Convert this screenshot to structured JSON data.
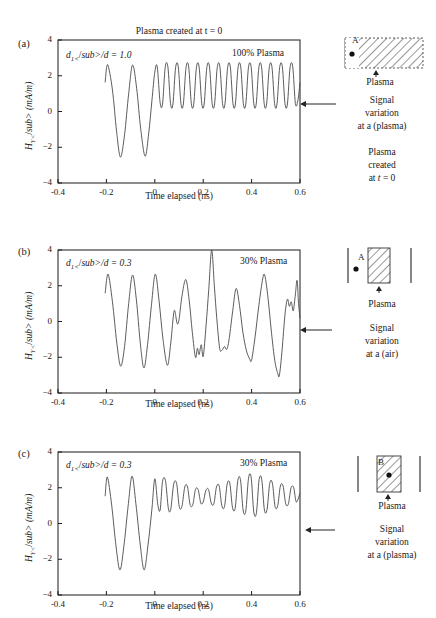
{
  "figure": {
    "title": "Plasma created at t = 0",
    "axis": {
      "xlabel": "Time elapsed (ns)",
      "ylabel_html": "H<sub>Y</sub> (mA/m)",
      "xticks": [
        "-0.4",
        "-0.2",
        "0",
        "0.2",
        "0.4",
        "0.6"
      ],
      "yticks": [
        "4",
        "2",
        "0",
        "-2",
        "-4"
      ],
      "xlim": [
        -0.4,
        0.6
      ],
      "ylim": [
        -4,
        4
      ]
    },
    "line_color": "#4a4a4a",
    "axis_color": "#1a1a1a"
  },
  "panels": [
    {
      "letter": "(a)",
      "ratio_label_html": "d<sub>1</sub>/d = 1.0",
      "percent_label": "100% Plasma",
      "title": "Plasma created at t = 0",
      "diagram": {
        "point_label": "A",
        "plasma_label": "Plasma",
        "type": "full-hatched-region"
      },
      "side_note_lines": [
        "Signal",
        "variation",
        "at a (plasma)"
      ],
      "extra_note_lines": [
        "Plasma",
        "created",
        "at t = 0"
      ]
    },
    {
      "letter": "(b)",
      "ratio_label_html": "d<sub>1</sub>/d = 0.3",
      "percent_label": "30% Plasma",
      "diagram": {
        "point_label": "A",
        "plasma_label": "Plasma",
        "type": "slab-right-of-point"
      },
      "side_note_lines": [
        "Signal",
        "variation",
        "at a (air)"
      ],
      "extra_note_lines": []
    },
    {
      "letter": "(c)",
      "ratio_label_html": "d<sub>1</sub>/d = 0.3",
      "percent_label": "30% Plasma",
      "diagram": {
        "point_label": "B",
        "plasma_label": "Plasma",
        "type": "point-inside-slab"
      },
      "side_note_lines": [
        "Signal",
        "variation",
        "at a (plasma)"
      ],
      "extra_note_lines": []
    }
  ],
  "chart_data": {
    "type": "line",
    "title": "Plasma created at t = 0",
    "xlabel": "Time elapsed (ns)",
    "ylabel": "H_Y (mA/m)",
    "xlim": [
      -0.4,
      0.6
    ],
    "ylim": [
      -4,
      4
    ],
    "xticks": [
      -0.4,
      -0.2,
      0,
      0.2,
      0.4,
      0.6
    ],
    "yticks": [
      -4,
      -2,
      0,
      2,
      4
    ],
    "grid": false,
    "legend": "none",
    "series": [
      {
        "name": "(a) 100% Plasma, d1/d = 1.0",
        "description": "Signal starts at t = -0.205 ns with two large low-frequency oscillations of amplitude about 2.6, then after t = 0 settles into a steady high-frequency ripple oscillating between about 0.4 and 2.5 around a mean of 1.45.",
        "signal_start_x": -0.205,
        "pre_zero_freq_ghz": 12.5,
        "pre_zero_amplitude": 2.6,
        "post_zero_freq_ghz": 23.5,
        "post_zero_amplitude": 1.05,
        "post_zero_offset": 1.45,
        "points": [
          [
            -0.205,
            1.65
          ],
          [
            -0.195,
            2.62
          ],
          [
            -0.175,
            1.2
          ],
          [
            -0.158,
            -1.1
          ],
          [
            -0.142,
            -2.55
          ],
          [
            -0.125,
            -1.3
          ],
          [
            -0.108,
            1.0
          ],
          [
            -0.092,
            2.6
          ],
          [
            -0.075,
            1.3
          ],
          [
            -0.058,
            -1.0
          ],
          [
            -0.04,
            -2.5
          ],
          [
            -0.025,
            -1.2
          ],
          [
            -0.012,
            0.6
          ],
          [
            0.0,
            2.2
          ],
          [
            0.01,
            2.5
          ],
          [
            0.022,
            0.5
          ],
          [
            0.032,
            0.42
          ],
          [
            0.043,
            2.48
          ],
          [
            0.054,
            2.5
          ],
          [
            0.065,
            0.45
          ],
          [
            0.075,
            0.42
          ],
          [
            0.086,
            2.46
          ],
          [
            0.097,
            2.5
          ],
          [
            0.108,
            0.44
          ],
          [
            0.118,
            0.42
          ],
          [
            0.129,
            2.46
          ],
          [
            0.14,
            2.5
          ],
          [
            0.151,
            0.44
          ],
          [
            0.161,
            0.42
          ],
          [
            0.172,
            2.46
          ],
          [
            0.183,
            2.5
          ],
          [
            0.194,
            0.44
          ],
          [
            0.204,
            0.42
          ],
          [
            0.215,
            2.46
          ],
          [
            0.226,
            2.5
          ],
          [
            0.237,
            0.44
          ],
          [
            0.247,
            0.42
          ],
          [
            0.258,
            2.46
          ],
          [
            0.269,
            2.5
          ],
          [
            0.28,
            0.44
          ],
          [
            0.29,
            0.42
          ],
          [
            0.301,
            2.46
          ],
          [
            0.312,
            2.5
          ],
          [
            0.323,
            0.44
          ],
          [
            0.333,
            0.42
          ],
          [
            0.344,
            2.46
          ],
          [
            0.355,
            2.5
          ],
          [
            0.366,
            0.44
          ],
          [
            0.376,
            0.42
          ],
          [
            0.387,
            2.46
          ],
          [
            0.398,
            2.5
          ],
          [
            0.409,
            0.44
          ],
          [
            0.419,
            0.42
          ],
          [
            0.43,
            2.46
          ],
          [
            0.441,
            2.5
          ],
          [
            0.452,
            0.44
          ],
          [
            0.462,
            0.42
          ],
          [
            0.473,
            2.46
          ],
          [
            0.484,
            2.5
          ],
          [
            0.495,
            0.44
          ],
          [
            0.505,
            0.42
          ],
          [
            0.516,
            2.46
          ],
          [
            0.527,
            2.5
          ],
          [
            0.538,
            0.44
          ],
          [
            0.548,
            0.42
          ],
          [
            0.559,
            2.46
          ],
          [
            0.57,
            2.5
          ],
          [
            0.581,
            0.44
          ],
          [
            0.591,
            0.6
          ],
          [
            0.6,
            1.6
          ]
        ]
      },
      {
        "name": "(b) 30% Plasma, d1/d = 0.3, observed in air",
        "description": "Irregular beating waveform with mixed frequencies; largest positive peak reaches 4.0 at about t = 0.235 ns and the deepest trough reaches about -3.0 near t = 0.515 ns.",
        "signal_start_x": -0.205,
        "max_value": 4.0,
        "max_at_x": 0.235,
        "min_value": -3.0,
        "min_at_x": 0.515,
        "points": [
          [
            -0.205,
            1.6
          ],
          [
            -0.193,
            2.65
          ],
          [
            -0.175,
            1.1
          ],
          [
            -0.157,
            -1.2
          ],
          [
            -0.141,
            -2.5
          ],
          [
            -0.125,
            -1.4
          ],
          [
            -0.108,
            1.0
          ],
          [
            -0.092,
            2.6
          ],
          [
            -0.076,
            1.2
          ],
          [
            -0.06,
            -1.2
          ],
          [
            -0.045,
            -2.6
          ],
          [
            -0.03,
            -1.3
          ],
          [
            -0.014,
            0.9
          ],
          [
            0.002,
            2.65
          ],
          [
            0.018,
            1.1
          ],
          [
            0.034,
            -1.0
          ],
          [
            0.052,
            -2.45
          ],
          [
            0.066,
            -1.2
          ],
          [
            0.08,
            0.6
          ],
          [
            0.092,
            -0.1
          ],
          [
            0.1,
            0.1
          ],
          [
            0.112,
            1.4
          ],
          [
            0.128,
            2.35
          ],
          [
            0.142,
            1.2
          ],
          [
            0.155,
            -0.6
          ],
          [
            0.168,
            -2.0
          ],
          [
            0.176,
            -1.5
          ],
          [
            0.183,
            -1.85
          ],
          [
            0.192,
            -1.3
          ],
          [
            0.2,
            -1.95
          ],
          [
            0.212,
            -0.2
          ],
          [
            0.223,
            1.8
          ],
          [
            0.235,
            4.0
          ],
          [
            0.246,
            2.0
          ],
          [
            0.256,
            0.2
          ],
          [
            0.268,
            -1.5
          ],
          [
            0.278,
            -1.6
          ],
          [
            0.288,
            -1.4
          ],
          [
            0.298,
            -1.55
          ],
          [
            0.308,
            -0.9
          ],
          [
            0.322,
            0.6
          ],
          [
            0.336,
            1.85
          ],
          [
            0.35,
            0.9
          ],
          [
            0.364,
            -0.6
          ],
          [
            0.378,
            -1.6
          ],
          [
            0.392,
            -2.1
          ],
          [
            0.4,
            -2.15
          ],
          [
            0.414,
            -0.9
          ],
          [
            0.43,
            0.9
          ],
          [
            0.446,
            2.4
          ],
          [
            0.455,
            2.55
          ],
          [
            0.468,
            1.3
          ],
          [
            0.482,
            -0.6
          ],
          [
            0.496,
            -2.2
          ],
          [
            0.508,
            -2.9
          ],
          [
            0.515,
            -3.0
          ],
          [
            0.526,
            -1.6
          ],
          [
            0.538,
            0.4
          ],
          [
            0.548,
            1.25
          ],
          [
            0.556,
            0.85
          ],
          [
            0.564,
            1.1
          ],
          [
            0.572,
            0.6
          ],
          [
            0.58,
            1.4
          ],
          [
            0.588,
            2.3
          ],
          [
            0.594,
            1.0
          ],
          [
            0.6,
            0.2
          ]
        ]
      },
      {
        "name": "(c) 30% Plasma, d1/d = 0.3, observed in plasma",
        "description": "Two large initial oscillations of amplitude about 2.6, then a positive-offset amplitude-modulated ripple between about 0.5 and 2.6 that shows slow beating with minima of envelope near t = 0.2 and t = 0.5.",
        "signal_start_x": -0.205,
        "pre_zero_amplitude": 2.6,
        "post_zero_offset": 1.5,
        "points": [
          [
            -0.205,
            1.55
          ],
          [
            -0.196,
            2.6
          ],
          [
            -0.178,
            1.0
          ],
          [
            -0.16,
            -1.3
          ],
          [
            -0.144,
            -2.6
          ],
          [
            -0.128,
            -1.3
          ],
          [
            -0.11,
            1.0
          ],
          [
            -0.094,
            2.65
          ],
          [
            -0.078,
            1.1
          ],
          [
            -0.06,
            -1.2
          ],
          [
            -0.044,
            -2.6
          ],
          [
            -0.028,
            -1.2
          ],
          [
            -0.012,
            0.8
          ],
          [
            0.0,
            2.5
          ],
          [
            0.012,
            1.1
          ],
          [
            0.022,
            0.75
          ],
          [
            0.032,
            2.35
          ],
          [
            0.044,
            2.4
          ],
          [
            0.056,
            0.85
          ],
          [
            0.066,
            0.8
          ],
          [
            0.078,
            2.2
          ],
          [
            0.09,
            2.25
          ],
          [
            0.101,
            0.95
          ],
          [
            0.112,
            0.95
          ],
          [
            0.124,
            2.05
          ],
          [
            0.135,
            2.05
          ],
          [
            0.146,
            1.05
          ],
          [
            0.157,
            1.05
          ],
          [
            0.168,
            1.9
          ],
          [
            0.179,
            1.9
          ],
          [
            0.19,
            1.15
          ],
          [
            0.2,
            1.2
          ],
          [
            0.211,
            1.85
          ],
          [
            0.222,
            1.9
          ],
          [
            0.233,
            1.15
          ],
          [
            0.244,
            1.1
          ],
          [
            0.255,
            2.05
          ],
          [
            0.266,
            2.1
          ],
          [
            0.277,
            1.0
          ],
          [
            0.288,
            0.95
          ],
          [
            0.299,
            2.2
          ],
          [
            0.31,
            2.25
          ],
          [
            0.321,
            0.9
          ],
          [
            0.332,
            0.85
          ],
          [
            0.343,
            2.4
          ],
          [
            0.354,
            2.45
          ],
          [
            0.365,
            0.75
          ],
          [
            0.376,
            0.7
          ],
          [
            0.387,
            2.5
          ],
          [
            0.398,
            2.6
          ],
          [
            0.409,
            0.65
          ],
          [
            0.42,
            0.6
          ],
          [
            0.431,
            2.45
          ],
          [
            0.442,
            2.45
          ],
          [
            0.453,
            0.75
          ],
          [
            0.464,
            0.8
          ],
          [
            0.475,
            2.25
          ],
          [
            0.486,
            2.25
          ],
          [
            0.497,
            0.95
          ],
          [
            0.508,
            1.0
          ],
          [
            0.519,
            2.1
          ],
          [
            0.53,
            2.1
          ],
          [
            0.541,
            1.1
          ],
          [
            0.552,
            1.1
          ],
          [
            0.563,
            2.0
          ],
          [
            0.574,
            2.0
          ],
          [
            0.585,
            1.2
          ],
          [
            0.6,
            1.7
          ]
        ]
      }
    ]
  }
}
